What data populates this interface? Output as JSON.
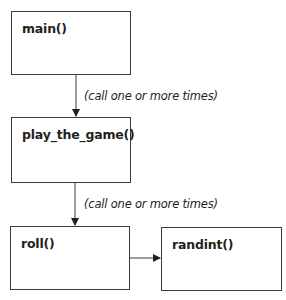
{
  "diagram": {
    "nodes": [
      {
        "id": "main",
        "label": "main()"
      },
      {
        "id": "play_the_game",
        "label": "play_the_game()"
      },
      {
        "id": "roll",
        "label": "roll()"
      },
      {
        "id": "randint",
        "label": "randint()"
      }
    ],
    "edges": [
      {
        "from": "main",
        "to": "play_the_game",
        "label": "(call one or more times)"
      },
      {
        "from": "play_the_game",
        "to": "roll",
        "label": "(call one or more times)"
      },
      {
        "from": "roll",
        "to": "randint",
        "label": ""
      }
    ]
  }
}
